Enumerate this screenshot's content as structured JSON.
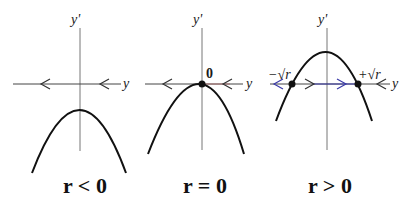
{
  "figure": {
    "colors": {
      "axis": "#555555",
      "curve": "#111111",
      "arrow": "#333333",
      "flow_blue": "#3a3aa8",
      "flow_red": "#b04040"
    },
    "panels": [
      {
        "id": "r-negative",
        "caption": "r < 0",
        "vertical_axis_label": "y'",
        "horizontal_axis_label": "y",
        "fixed_points": [],
        "flow_arrows": [
          "left",
          "left"
        ]
      },
      {
        "id": "r-zero",
        "caption": "r = 0",
        "vertical_axis_label": "y'",
        "horizontal_axis_label": "y",
        "fixed_points": [
          {
            "label": "0"
          }
        ],
        "flow_arrows": [
          "left",
          "left"
        ]
      },
      {
        "id": "r-positive",
        "caption": "r > 0",
        "vertical_axis_label": "y'",
        "horizontal_axis_label": "y",
        "fixed_points": [
          {
            "label": "−√r"
          },
          {
            "label": "+√r"
          }
        ],
        "flow_arrows": [
          "left",
          "right",
          "right",
          "left"
        ]
      }
    ]
  }
}
